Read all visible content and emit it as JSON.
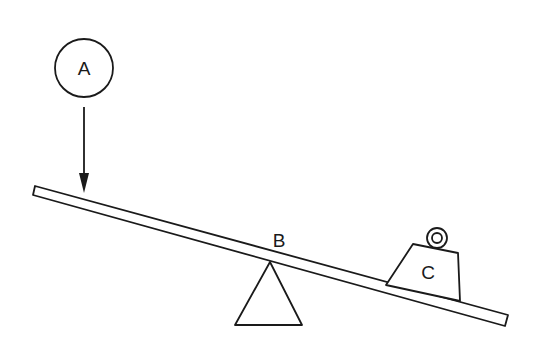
{
  "diagram": {
    "labels": {
      "force": "A",
      "fulcrum": "B",
      "load": "C"
    },
    "colors": {
      "ink": "#1a1a1a",
      "background": "#ffffff"
    },
    "elements": [
      {
        "id": "A",
        "kind": "force",
        "shape": "circle-with-downward-arrow"
      },
      {
        "id": "B",
        "kind": "fulcrum",
        "shape": "triangle"
      },
      {
        "id": "C",
        "kind": "load",
        "shape": "weight-with-ring"
      },
      {
        "id": "beam",
        "kind": "lever-arm",
        "shape": "tilted-bar"
      }
    ]
  }
}
